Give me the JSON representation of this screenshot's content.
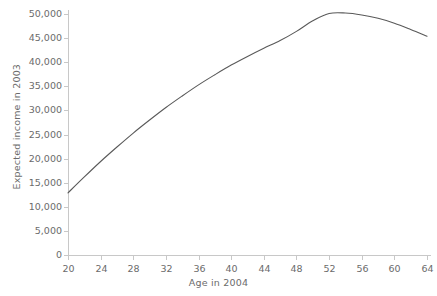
{
  "chart_data": {
    "type": "line",
    "title": "",
    "xlabel": "Age in 2004",
    "ylabel": "Expected income in 2003",
    "xlim": [
      20,
      64
    ],
    "ylim": [
      0,
      50000
    ],
    "grid": false,
    "legend": "none",
    "line_color": "#595959",
    "axis_color": "#c8c8c8",
    "text_color": "#6b6b6b",
    "xticks": [
      20,
      24,
      28,
      32,
      36,
      40,
      44,
      48,
      52,
      56,
      60,
      64
    ],
    "xtick_labels": [
      "20",
      "24",
      "28",
      "32",
      "36",
      "40",
      "44",
      "48",
      "52",
      "56",
      "60",
      "64"
    ],
    "yticks": [
      0,
      5000,
      10000,
      15000,
      20000,
      25000,
      30000,
      35000,
      40000,
      45000,
      50000
    ],
    "ytick_labels": [
      "0",
      "5,000",
      "10,000",
      "15,000",
      "20,000",
      "25,000",
      "30,000",
      "35,000",
      "40,000",
      "45,000",
      "50,000"
    ],
    "series": [
      {
        "name": "Expected income",
        "x": [
          20,
          22,
          24,
          26,
          28,
          30,
          32,
          34,
          36,
          38,
          40,
          42,
          44,
          46,
          48,
          50,
          52,
          54,
          56,
          58,
          60,
          62,
          64
        ],
        "values": [
          12900,
          16200,
          19400,
          22400,
          25300,
          28000,
          30600,
          33000,
          35300,
          37400,
          39400,
          41200,
          42900,
          44500,
          46400,
          48600,
          50100,
          50200,
          49800,
          49100,
          48100,
          46800,
          45400
        ]
      }
    ]
  }
}
